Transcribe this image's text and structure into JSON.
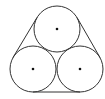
{
  "diagram": {
    "title": "Three tangent circles wrapped by a belt",
    "stroke_color": "#333333",
    "background": "#ffffff",
    "circles": [
      {
        "name": "top",
        "cx": 57,
        "cy": 29,
        "r": 23
      },
      {
        "name": "bottom-left",
        "cx": 33,
        "cy": 69,
        "r": 23
      },
      {
        "name": "bottom-right",
        "cx": 80,
        "cy": 69,
        "r": 23
      }
    ],
    "center_dot_radius": 1.3,
    "belt": {
      "segments": [
        {
          "name": "left",
          "x1": 13,
          "y1": 57.5,
          "x2": 37,
          "y2": 17.5
        },
        {
          "name": "right",
          "x1": 77,
          "y1": 17.5,
          "x2": 100,
          "y2": 57.5
        },
        {
          "name": "bottom",
          "x1": 33,
          "y1": 92,
          "x2": 80,
          "y2": 92
        }
      ]
    }
  }
}
